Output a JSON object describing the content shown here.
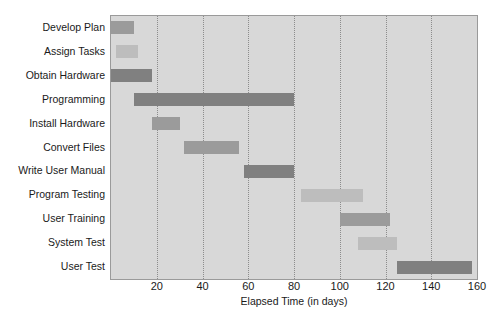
{
  "chart_data": {
    "type": "bar",
    "subtype": "gantt",
    "title": "",
    "xlabel": "Elapsed Time (in days)",
    "ylabel": "",
    "xlim": [
      0,
      160
    ],
    "xticks": [
      0,
      20,
      40,
      60,
      80,
      100,
      120,
      140,
      160
    ],
    "xtick_labels": [
      "",
      "20",
      "40",
      "60",
      "80",
      "100",
      "120",
      "140",
      "160"
    ],
    "grid": "vertical-dotted",
    "legend": "none",
    "categories": [
      "Develop Plan",
      "Assign Tasks",
      "Obtain Hardware",
      "Programming",
      "Install Hardware",
      "Convert Files",
      "Write User Manual",
      "Program Testing",
      "User Training",
      "System Test",
      "User Test"
    ],
    "tasks": [
      {
        "name": "Develop Plan",
        "start": 0,
        "end": 10,
        "duration": 10,
        "shade": "medium"
      },
      {
        "name": "Assign Tasks",
        "start": 2,
        "end": 12,
        "duration": 10,
        "shade": "light"
      },
      {
        "name": "Obtain Hardware",
        "start": 0,
        "end": 18,
        "duration": 18,
        "shade": "dark"
      },
      {
        "name": "Programming",
        "start": 10,
        "end": 80,
        "duration": 70,
        "shade": "dark"
      },
      {
        "name": "Install Hardware",
        "start": 18,
        "end": 30,
        "duration": 12,
        "shade": "medium"
      },
      {
        "name": "Convert Files",
        "start": 32,
        "end": 56,
        "duration": 24,
        "shade": "medium"
      },
      {
        "name": "Write User Manual",
        "start": 58,
        "end": 80,
        "duration": 22,
        "shade": "dark"
      },
      {
        "name": "Program Testing",
        "start": 83,
        "end": 110,
        "duration": 27,
        "shade": "light"
      },
      {
        "name": "User Training",
        "start": 100,
        "end": 122,
        "duration": 22,
        "shade": "medium"
      },
      {
        "name": "System Test",
        "start": 108,
        "end": 125,
        "duration": 17,
        "shade": "light"
      },
      {
        "name": "User Test",
        "start": 125,
        "end": 158,
        "duration": 33,
        "shade": "dark"
      }
    ],
    "colors": {
      "plot_background": "#d8d8d8",
      "bar_dark": "#808080",
      "bar_medium": "#9b9b9b",
      "bar_light": "#bdbdbd",
      "gridline": "#8c8c8c",
      "axis_border": "#9a9a9a",
      "text": "#1a1a1a",
      "page_background": "#ffffff"
    }
  }
}
